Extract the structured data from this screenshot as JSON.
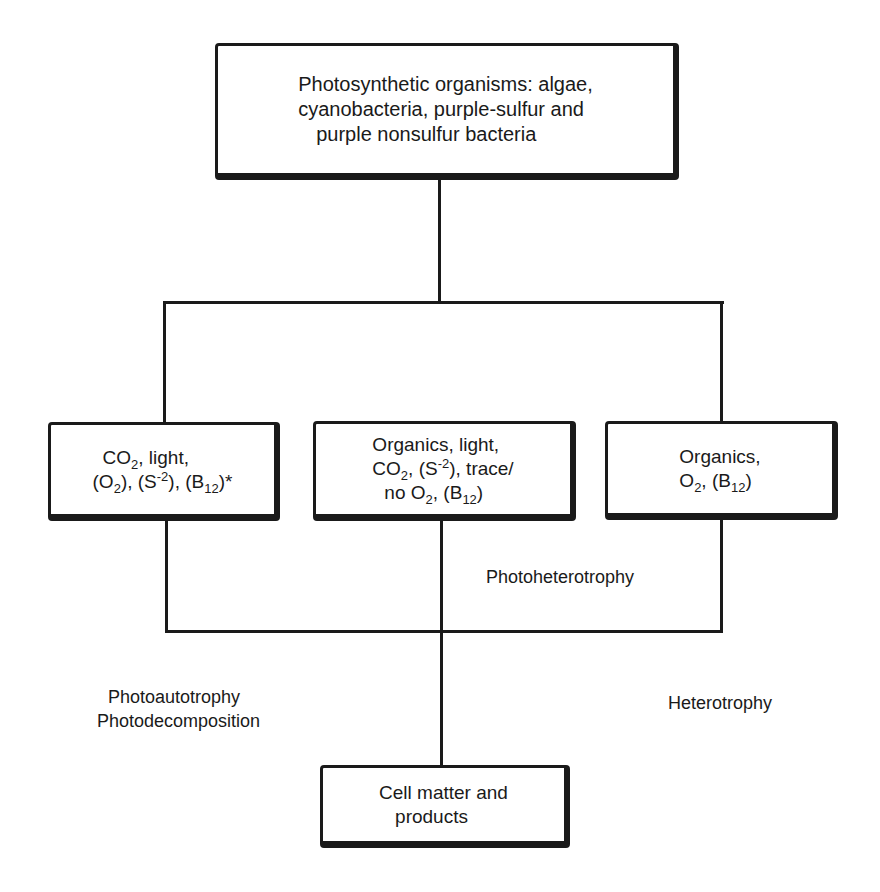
{
  "diagram": {
    "title_box": {
      "lines": [
        "Photosynthetic organisms: algae,",
        "cyanobacteria, purple-sulfur and",
        "purple nonsulfur bacteria"
      ]
    },
    "input_boxes": [
      {
        "id": "photoautotrophy-inputs",
        "text": "CO2, light, (O2), (S-2), (B12)*"
      },
      {
        "id": "photoheterotrophy-inputs",
        "text": "Organics, light, CO2, (S-2), trace/ no O2, (B12)"
      },
      {
        "id": "heterotrophy-inputs",
        "text": "Organics, O2, (B12)"
      }
    ],
    "labels": {
      "photoheterotrophy": "Photoheterotrophy",
      "photoautotrophy": "Photoautotrophy",
      "photodecomposition": "Photodecomposition",
      "heterotrophy": "Heterotrophy"
    },
    "output_box": {
      "lines": [
        "Cell matter and",
        "products"
      ]
    },
    "tokens": {
      "co": "CO",
      "o": "O",
      "s": "S",
      "b": "B",
      "sub2": "2",
      "sub12": "12",
      "supneg2": "-2",
      "light": ", light,",
      "organics_light": "Organics, light,",
      "organics": "Organics,",
      "trace": "), trace/",
      "no": "no O",
      "asterisk": "*"
    }
  }
}
